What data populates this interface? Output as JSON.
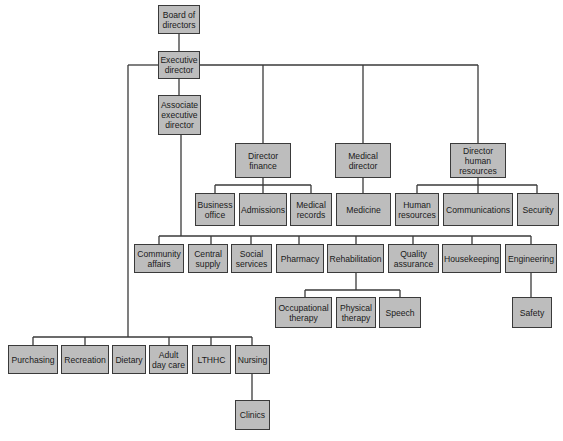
{
  "diagram": {
    "type": "org-chart",
    "nodes": {
      "board": {
        "label": "Board of\ndirectors"
      },
      "executive": {
        "label": "Executive\ndirector"
      },
      "associate": {
        "label": "Associate\nexecutive\ndirector"
      },
      "finance": {
        "label": "Director\nfinance"
      },
      "medical": {
        "label": "Medical\ndirector"
      },
      "hr_director": {
        "label": "Director\nhuman\nresources"
      },
      "business_office": {
        "label": "Business\noffice"
      },
      "admissions": {
        "label": "Admissions"
      },
      "medical_records": {
        "label": "Medical\nrecords"
      },
      "medicine": {
        "label": "Medicine"
      },
      "human_resources": {
        "label": "Human\nresources"
      },
      "communications": {
        "label": "Communications"
      },
      "security": {
        "label": "Security"
      },
      "community_affairs": {
        "label": "Community\naffairs"
      },
      "central_supply": {
        "label": "Central\nsupply"
      },
      "social_services": {
        "label": "Social\nservices"
      },
      "pharmacy": {
        "label": "Pharmacy"
      },
      "rehabilitation": {
        "label": "Rehabilitation"
      },
      "quality_assurance": {
        "label": "Quality\nassurance"
      },
      "housekeeping": {
        "label": "Housekeeping"
      },
      "engineering": {
        "label": "Engineering"
      },
      "occupational_therapy": {
        "label": "Occupational\ntherapy"
      },
      "physical_therapy": {
        "label": "Physical\ntherapy"
      },
      "speech": {
        "label": "Speech"
      },
      "safety": {
        "label": "Safety"
      },
      "purchasing": {
        "label": "Purchasing"
      },
      "recreation": {
        "label": "Recreation"
      },
      "dietary": {
        "label": "Dietary"
      },
      "adult_day_care": {
        "label": "Adult\nday care"
      },
      "lthhc": {
        "label": "LTHHC"
      },
      "nursing": {
        "label": "Nursing"
      },
      "clinics": {
        "label": "Clinics"
      }
    },
    "edges": [
      [
        "board",
        "executive"
      ],
      [
        "executive",
        "associate"
      ],
      [
        "executive",
        "finance"
      ],
      [
        "executive",
        "medical"
      ],
      [
        "executive",
        "hr_director"
      ],
      [
        "finance",
        "business_office"
      ],
      [
        "finance",
        "admissions"
      ],
      [
        "finance",
        "medical_records"
      ],
      [
        "medical",
        "medicine"
      ],
      [
        "hr_director",
        "human_resources"
      ],
      [
        "hr_director",
        "communications"
      ],
      [
        "hr_director",
        "security"
      ],
      [
        "associate",
        "community_affairs"
      ],
      [
        "associate",
        "central_supply"
      ],
      [
        "associate",
        "social_services"
      ],
      [
        "associate",
        "pharmacy"
      ],
      [
        "associate",
        "rehabilitation"
      ],
      [
        "associate",
        "quality_assurance"
      ],
      [
        "associate",
        "housekeeping"
      ],
      [
        "associate",
        "engineering"
      ],
      [
        "rehabilitation",
        "occupational_therapy"
      ],
      [
        "rehabilitation",
        "physical_therapy"
      ],
      [
        "rehabilitation",
        "speech"
      ],
      [
        "engineering",
        "safety"
      ],
      [
        "executive",
        "purchasing"
      ],
      [
        "executive",
        "recreation"
      ],
      [
        "executive",
        "dietary"
      ],
      [
        "executive",
        "adult_day_care"
      ],
      [
        "executive",
        "lthhc"
      ],
      [
        "executive",
        "nursing"
      ],
      [
        "nursing",
        "clinics"
      ]
    ]
  },
  "colors": {
    "box_fill": "#bdbdbd",
    "box_border": "#3a3a3a",
    "line": "#3a3a3a",
    "background": "#ffffff"
  }
}
